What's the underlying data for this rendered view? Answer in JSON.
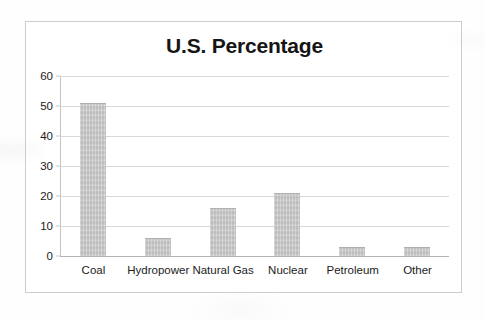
{
  "document": {
    "kind": "scanned-chart-page",
    "background_color": "#fefefe",
    "frame_color": "#cdcdcd"
  },
  "chart_data": {
    "type": "bar",
    "title": "U.S. Percentage",
    "xlabel": "",
    "ylabel": "",
    "categories": [
      "Coal",
      "Hydropower",
      "Natural Gas",
      "Nuclear",
      "Petroleum",
      "Other"
    ],
    "values": [
      51,
      6,
      16,
      21,
      3,
      3
    ],
    "ylim": [
      0,
      60
    ],
    "ytick_step": 10,
    "ytick_labels": [
      "60",
      "50",
      "40",
      "30",
      "20",
      "10",
      "0"
    ],
    "ytick_values": [
      60,
      50,
      40,
      30,
      20,
      10,
      0
    ],
    "grid": true,
    "grid_orientation": "horizontal",
    "legend": false,
    "legend_position": "none",
    "bar_color": "#c9c9c9",
    "bar_edge_color": "#b0b0b0",
    "gridline_color": "#d8d8d8",
    "axis_color": "#b4b4b4",
    "series": [
      {
        "name": "U.S. Percentage",
        "values": [
          51,
          6,
          16,
          21,
          3,
          3
        ]
      }
    ],
    "points": [
      {
        "category": "Coal",
        "value": 51
      },
      {
        "category": "Hydropower",
        "value": 6
      },
      {
        "category": "Natural Gas",
        "value": 16
      },
      {
        "category": "Nuclear",
        "value": 21
      },
      {
        "category": "Petroleum",
        "value": 3
      },
      {
        "category": "Other",
        "value": 3
      }
    ]
  }
}
